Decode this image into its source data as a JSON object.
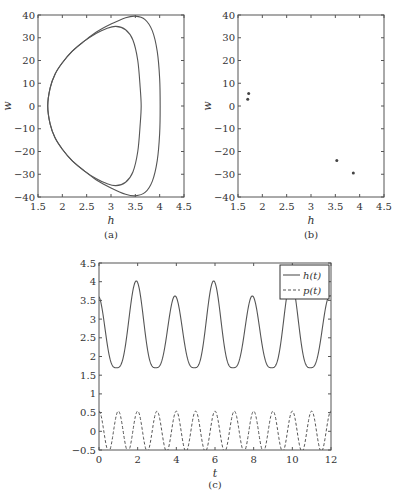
{
  "chart_data": [
    {
      "id": "a",
      "type": "line",
      "caption": "(a)",
      "xlabel": "h",
      "ylabel": "w",
      "xlim": [
        1.5,
        4.5
      ],
      "ylim": [
        -40,
        40
      ],
      "xticks": [
        1.5,
        2,
        2.5,
        3,
        3.5,
        4,
        4.5
      ],
      "xtick_labels": [
        "1.5",
        "2",
        "2.5",
        "3",
        "3.5",
        "4",
        "4.5"
      ],
      "yticks": [
        -40,
        -30,
        -20,
        -10,
        0,
        10,
        20,
        30,
        40
      ],
      "ytick_labels": [
        "−40",
        "−30",
        "−20",
        "−10",
        "0",
        "10",
        "20",
        "30",
        "40"
      ],
      "grid": false,
      "series": [
        {
          "name": "inner orbit",
          "closed": true,
          "points": [
            [
              1.7,
              0
            ],
            [
              1.75,
              8
            ],
            [
              1.85,
              14
            ],
            [
              2.0,
              19
            ],
            [
              2.2,
              24
            ],
            [
              2.45,
              28.5
            ],
            [
              2.7,
              32
            ],
            [
              2.9,
              34
            ],
            [
              3.1,
              35
            ],
            [
              3.3,
              33.5
            ],
            [
              3.45,
              29
            ],
            [
              3.55,
              20
            ],
            [
              3.6,
              8
            ],
            [
              3.62,
              0
            ],
            [
              3.6,
              -8
            ],
            [
              3.55,
              -20
            ],
            [
              3.45,
              -29
            ],
            [
              3.3,
              -33.5
            ],
            [
              3.1,
              -35
            ],
            [
              2.9,
              -34
            ],
            [
              2.7,
              -32
            ],
            [
              2.45,
              -28.5
            ],
            [
              2.2,
              -24
            ],
            [
              2.0,
              -19
            ],
            [
              1.85,
              -14
            ],
            [
              1.75,
              -8
            ]
          ]
        },
        {
          "name": "outer orbit",
          "closed": true,
          "points": [
            [
              1.7,
              0
            ],
            [
              1.75,
              8
            ],
            [
              1.85,
              14
            ],
            [
              2.0,
              19
            ],
            [
              2.2,
              24
            ],
            [
              2.45,
              28.5
            ],
            [
              2.7,
              32.5
            ],
            [
              3.0,
              36
            ],
            [
              3.3,
              38.8
            ],
            [
              3.5,
              39.5
            ],
            [
              3.7,
              38
            ],
            [
              3.85,
              33
            ],
            [
              3.95,
              24
            ],
            [
              4.0,
              12
            ],
            [
              4.01,
              0
            ],
            [
              4.0,
              -12
            ],
            [
              3.95,
              -24
            ],
            [
              3.85,
              -33
            ],
            [
              3.7,
              -38
            ],
            [
              3.5,
              -39.5
            ],
            [
              3.3,
              -38.8
            ],
            [
              3.0,
              -36
            ],
            [
              2.7,
              -32.5
            ],
            [
              2.45,
              -28.5
            ],
            [
              2.2,
              -24
            ],
            [
              2.0,
              -19
            ],
            [
              1.85,
              -14
            ],
            [
              1.75,
              -8
            ]
          ]
        }
      ]
    },
    {
      "id": "b",
      "type": "scatter",
      "caption": "(b)",
      "xlabel": "h",
      "ylabel": "w",
      "xlim": [
        1.5,
        4.5
      ],
      "ylim": [
        -40,
        40
      ],
      "xticks": [
        1.5,
        2,
        2.5,
        3,
        3.5,
        4,
        4.5
      ],
      "xtick_labels": [
        "1.5",
        "2",
        "2.5",
        "3",
        "3.5",
        "4",
        "4.5"
      ],
      "yticks": [
        -40,
        -30,
        -20,
        -10,
        0,
        10,
        20,
        30,
        40
      ],
      "ytick_labels": [
        "−40",
        "−30",
        "−20",
        "−10",
        "0",
        "10",
        "20",
        "30",
        "40"
      ],
      "grid": false,
      "series": [
        {
          "name": "Poincaré points",
          "points": [
            [
              1.7,
              3
            ],
            [
              1.72,
              5.5
            ],
            [
              3.53,
              -24
            ],
            [
              3.87,
              -29.5
            ]
          ]
        }
      ]
    },
    {
      "id": "c",
      "type": "line",
      "caption": "(c)",
      "xlabel": "t",
      "ylabel": "",
      "xlim": [
        0,
        12
      ],
      "ylim": [
        -0.5,
        4.5
      ],
      "xticks": [
        0,
        2,
        4,
        6,
        8,
        10,
        12
      ],
      "xtick_labels": [
        "0",
        "2",
        "4",
        "6",
        "8",
        "10",
        "12"
      ],
      "yticks": [
        -0.5,
        0,
        0.5,
        1,
        1.5,
        2,
        2.5,
        3,
        3.5,
        4,
        4.5
      ],
      "ytick_labels": [
        "−0.5",
        "0",
        "0.5",
        "1",
        "1.5",
        "2",
        "2.5",
        "3",
        "3.5",
        "4",
        "4.5"
      ],
      "grid": false,
      "legend": {
        "position": "upper right",
        "entries": [
          "h(t)",
          "p(t)"
        ]
      },
      "series": [
        {
          "name": "h(t)",
          "style": "solid",
          "min": 1.7,
          "peaks": [
            [
              -0.05,
              3.62
            ],
            [
              1.93,
              4.02
            ],
            [
              3.93,
              3.62
            ],
            [
              5.93,
              4.02
            ],
            [
              7.93,
              3.62
            ],
            [
              9.93,
              4.02
            ],
            [
              11.93,
              3.62
            ]
          ],
          "troughs": [
            [
              0.9,
              1.7
            ],
            [
              2.93,
              1.7
            ],
            [
              4.93,
              1.7
            ],
            [
              6.93,
              1.7
            ],
            [
              8.93,
              1.7
            ],
            [
              10.93,
              1.7
            ]
          ]
        },
        {
          "name": "p(t)",
          "style": "dashed",
          "amplitude": 0.5,
          "period": 1.0,
          "phase_peak_t": 1.0
        }
      ]
    }
  ]
}
